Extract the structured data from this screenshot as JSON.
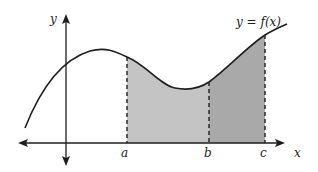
{
  "diagram": {
    "type": "area-under-curve",
    "curve_label": "y = f(x)",
    "axes": {
      "x_label": "x",
      "y_label": "y"
    },
    "points": [
      {
        "label": "a",
        "x": 127
      },
      {
        "label": "b",
        "x": 209
      },
      {
        "label": "c",
        "x": 265
      }
    ],
    "regions": [
      {
        "from": "a",
        "to": "b",
        "color": "#c4c4c4"
      },
      {
        "from": "b",
        "to": "c",
        "color": "#a9a9a9"
      }
    ],
    "line_color": "#1e1e1e"
  }
}
